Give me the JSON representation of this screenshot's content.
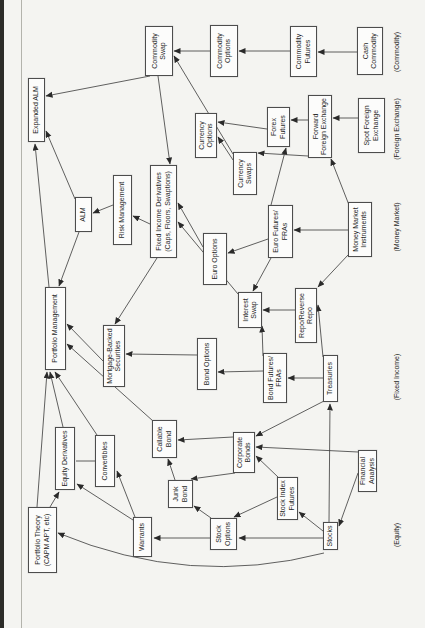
{
  "page": {
    "background": "#f4f4f1",
    "scan_edge_color": "#2c2c28",
    "fold_line_color": "#b3b3ac"
  },
  "diagram": {
    "box_border_color": "#4d4d4d",
    "box_background": "#fcfcfb",
    "line_color": "#383838",
    "text_color": "#1f1f1f",
    "nodes": [
      {
        "id": "portfolio_theory",
        "kind": "box",
        "label": "Portfolio Theory\n(CAPM APT, etc)",
        "x": 55,
        "y": 28,
        "w": 66,
        "h": 29
      },
      {
        "id": "equity_derivatives",
        "kind": "box",
        "label": "Equity Derivatives",
        "x": 138,
        "y": 55,
        "w": 63,
        "h": 20
      },
      {
        "id": "convertibles",
        "kind": "box",
        "label": "Convertibles",
        "x": 141,
        "y": 95,
        "w": 52,
        "h": 20
      },
      {
        "id": "warrants",
        "kind": "box",
        "label": "Warrants",
        "x": 71,
        "y": 133,
        "w": 40,
        "h": 19
      },
      {
        "id": "junk_bond",
        "kind": "box",
        "label": "Junk\nBond",
        "x": 120,
        "y": 168,
        "w": 28,
        "h": 25
      },
      {
        "id": "callable_bond",
        "kind": "box",
        "label": "Callable\nBond",
        "x": 170,
        "y": 152,
        "w": 38,
        "h": 25
      },
      {
        "id": "stock_options",
        "kind": "box",
        "label": "Stock\nOptions",
        "x": 78,
        "y": 210,
        "w": 32,
        "h": 27
      },
      {
        "id": "corporate_bonds",
        "kind": "box",
        "label": "Corporate\nBonds",
        "x": 155,
        "y": 233,
        "w": 41,
        "h": 22
      },
      {
        "id": "stock_index_futures",
        "kind": "box",
        "label": "Stock Index\nFutures",
        "x": 108,
        "y": 277,
        "w": 43,
        "h": 21
      },
      {
        "id": "stocks",
        "kind": "box",
        "label": "Stocks",
        "x": 78,
        "y": 323,
        "w": 28,
        "h": 15
      },
      {
        "id": "financial_analysis",
        "kind": "box",
        "label": "Financial\nAnalysis",
        "x": 136,
        "y": 358,
        "w": 42,
        "h": 19
      },
      {
        "id": "equity_label",
        "kind": "cat",
        "label": "(Equity)",
        "x": 63,
        "y": 391,
        "w": 60,
        "h": 12
      },
      {
        "id": "mortgage_backed",
        "kind": "box",
        "label": "Mortgage-Backed\nSecurities",
        "x": 241,
        "y": 103,
        "w": 62,
        "h": 22
      },
      {
        "id": "bond_options",
        "kind": "box",
        "label": "Bond Options",
        "x": 238,
        "y": 197,
        "w": 52,
        "h": 20
      },
      {
        "id": "bond_futures",
        "kind": "box",
        "label": "Bond Futures/\nFRAs",
        "x": 225,
        "y": 263,
        "w": 50,
        "h": 24
      },
      {
        "id": "treasuries",
        "kind": "box",
        "label": "Treasuries",
        "x": 226,
        "y": 323,
        "w": 47,
        "h": 15
      },
      {
        "id": "fixed_income_label",
        "kind": "cat",
        "label": "(Fixed Income)",
        "x": 221,
        "y": 391,
        "w": 60,
        "h": 12
      },
      {
        "id": "portfolio_management",
        "kind": "box",
        "label": "Portfolio Management",
        "x": 258,
        "y": 45,
        "w": 83,
        "h": 21
      },
      {
        "id": "interest_swap",
        "kind": "box",
        "label": "Interest\nSwap",
        "x": 300,
        "y": 238,
        "w": 36,
        "h": 24
      },
      {
        "id": "repo",
        "kind": "box",
        "label": "Repo/Reverse\nRepo",
        "x": 285,
        "y": 295,
        "w": 55,
        "h": 22
      },
      {
        "id": "euro_options",
        "kind": "box",
        "label": "Euro Options",
        "x": 343,
        "y": 203,
        "w": 52,
        "h": 24
      },
      {
        "id": "euro_futures",
        "kind": "box",
        "label": "Euro Futures/\nFRAs",
        "x": 370,
        "y": 268,
        "w": 53,
        "h": 25
      },
      {
        "id": "money_market_instruments",
        "kind": "box",
        "label": "Money Market\nInstruments",
        "x": 371,
        "y": 348,
        "w": 55,
        "h": 24
      },
      {
        "id": "money_market_label",
        "kind": "cat",
        "label": "(Money Market)",
        "x": 371,
        "y": 391,
        "w": 60,
        "h": 12
      },
      {
        "id": "alm",
        "kind": "box",
        "label": "ALM",
        "x": 396,
        "y": 75,
        "w": 35,
        "h": 17
      },
      {
        "id": "risk_management",
        "kind": "box",
        "label": "Risk Management",
        "x": 383,
        "y": 113,
        "w": 70,
        "h": 19
      },
      {
        "id": "fixed_income_derivatives",
        "kind": "box",
        "label": "Fixed Income Derivatives\n(Caps, Floors, Swaptions)",
        "x": 370,
        "y": 150,
        "w": 93,
        "h": 27
      },
      {
        "id": "currency_swaps",
        "kind": "box",
        "label": "Currency\nSwaps",
        "x": 433,
        "y": 233,
        "w": 43,
        "h": 24
      },
      {
        "id": "currency_options",
        "kind": "box",
        "label": "Currency\nOptions",
        "x": 470,
        "y": 195,
        "w": 45,
        "h": 22
      },
      {
        "id": "forex_futures",
        "kind": "box",
        "label": "Forex\nFutures",
        "x": 481,
        "y": 267,
        "w": 40,
        "h": 23
      },
      {
        "id": "forward_fx",
        "kind": "box",
        "label": "Forward\nForeign Exchange",
        "x": 470,
        "y": 308,
        "w": 63,
        "h": 24
      },
      {
        "id": "spot_fx",
        "kind": "box",
        "label": "Spot Foreign\nExchange",
        "x": 475,
        "y": 358,
        "w": 55,
        "h": 27
      },
      {
        "id": "fx_label",
        "kind": "cat",
        "label": "(Foreign Exchange)",
        "x": 459,
        "y": 391,
        "w": 80,
        "h": 12
      },
      {
        "id": "expanded_alm",
        "kind": "box",
        "label": "Expanded ALM",
        "x": 486,
        "y": 28,
        "w": 64,
        "h": 17
      },
      {
        "id": "commodity_swap",
        "kind": "box",
        "label": "Commodity\nSwap",
        "x": 552,
        "y": 145,
        "w": 50,
        "h": 28
      },
      {
        "id": "commodity_options",
        "kind": "box",
        "label": "Commodity\nOptions",
        "x": 551,
        "y": 210,
        "w": 52,
        "h": 28
      },
      {
        "id": "commodity_futures",
        "kind": "box",
        "label": "Commodity\nFutures",
        "x": 551,
        "y": 290,
        "w": 51,
        "h": 27
      },
      {
        "id": "cash_commodity",
        "kind": "box",
        "label": "Cash\nCommodity",
        "x": 553,
        "y": 357,
        "w": 48,
        "h": 26
      },
      {
        "id": "commodity_label",
        "kind": "cat",
        "label": "(Commodity)",
        "x": 546,
        "y": 391,
        "w": 60,
        "h": 12
      }
    ],
    "edges": [
      {
        "from": "stocks",
        "to": "stock_index_futures",
        "x1": 97,
        "y1": 323,
        "x2": 116,
        "y2": 299
      },
      {
        "from": "stocks",
        "to": "stock_options",
        "x1": 90,
        "y1": 323,
        "x2": 90,
        "y2": 239
      },
      {
        "from": "stock_index_futures",
        "to": "stock_options",
        "x1": 131,
        "y1": 277,
        "x2": 111,
        "y2": 234
      },
      {
        "from": "stock_options",
        "to": "warrants",
        "x1": 90,
        "y1": 210,
        "x2": 90,
        "y2": 154
      },
      {
        "from": "stock_options",
        "to": "junk_bond",
        "x1": 110,
        "y1": 211,
        "x2": 122,
        "y2": 194
      },
      {
        "from": "warrants",
        "to": "equity_derivatives",
        "x1": 108,
        "y1": 133,
        "x2": 144,
        "y2": 77
      },
      {
        "from": "warrants",
        "to": "convertibles",
        "x1": 111,
        "y1": 135,
        "x2": 157,
        "y2": 117
      },
      {
        "from": "convertibles",
        "to": "equity_derivatives",
        "x1": 167,
        "y1": 95,
        "x2": 167,
        "y2": 76,
        "plain": true
      },
      {
        "from": "portfolio_theory",
        "to": "equity_derivatives",
        "x1": 121,
        "y1": 50,
        "x2": 136,
        "y2": 59
      },
      {
        "from": "portfolio_theory",
        "to": "portfolio_management",
        "x1": 121,
        "y1": 37,
        "x2": 256,
        "y2": 47
      },
      {
        "from": "equity_derivatives",
        "to": "portfolio_management",
        "x1": 201,
        "y1": 63,
        "x2": 256,
        "y2": 50
      },
      {
        "from": "convertibles",
        "to": "portfolio_management",
        "x1": 193,
        "y1": 97,
        "x2": 256,
        "y2": 55
      },
      {
        "from": "callable_bond",
        "to": "portfolio_management",
        "x1": 207,
        "y1": 153,
        "x2": 284,
        "y2": 67
      },
      {
        "from": "mortgage_backed",
        "to": "portfolio_management",
        "x1": 267,
        "y1": 103,
        "x2": 304,
        "y2": 67
      },
      {
        "from": "alm",
        "to": "portfolio_management",
        "x1": 396,
        "y1": 79,
        "x2": 342,
        "y2": 59
      },
      {
        "from": "stocks",
        "to": "portfolio_theory",
        "x1": 75,
        "y1": 324,
        "cx": 40,
        "cy": 190,
        "x2": 95,
        "y2": 58,
        "curve": true
      },
      {
        "from": "financial_analysis",
        "to": "stocks",
        "x1": 155,
        "y1": 358,
        "x2": 102,
        "y2": 339
      },
      {
        "from": "financial_analysis",
        "to": "corporate_bonds",
        "x1": 176,
        "y1": 358,
        "x2": 181,
        "y2": 256
      },
      {
        "from": "treasuries",
        "to": "corporate_bonds",
        "x1": 227,
        "y1": 324,
        "x2": 192,
        "y2": 256
      },
      {
        "from": "stock_index_futures",
        "to": "corporate_bonds",
        "x1": 151,
        "y1": 278,
        "x2": 172,
        "y2": 256
      },
      {
        "from": "corporate_bonds",
        "to": "callable_bond",
        "x1": 191,
        "y1": 233,
        "x2": 188,
        "y2": 178
      },
      {
        "from": "corporate_bonds",
        "to": "junk_bond",
        "x1": 155,
        "y1": 235,
        "x2": 149,
        "y2": 191
      },
      {
        "from": "junk_bond",
        "to": "callable_bond",
        "x1": 148,
        "y1": 175,
        "x2": 169,
        "y2": 168
      },
      {
        "from": "treasuries",
        "to": "bond_futures",
        "x1": 250,
        "y1": 323,
        "x2": 250,
        "y2": 288
      },
      {
        "from": "treasuries",
        "to": "repo",
        "x1": 271,
        "y1": 323,
        "x2": 323,
        "y2": 318
      },
      {
        "from": "stocks",
        "to": "treasuries",
        "x1": 106,
        "y1": 329,
        "x2": 224,
        "y2": 330
      },
      {
        "from": "bond_futures",
        "to": "bond_options",
        "x1": 257,
        "y1": 263,
        "x2": 256,
        "y2": 218
      },
      {
        "from": "bond_futures",
        "to": "interest_swap",
        "x1": 272,
        "y1": 263,
        "x2": 302,
        "y2": 262
      },
      {
        "from": "repo",
        "to": "interest_swap",
        "x1": 318,
        "y1": 295,
        "x2": 318,
        "y2": 263
      },
      {
        "from": "euro_futures",
        "to": "interest_swap",
        "x1": 370,
        "y1": 271,
        "x2": 337,
        "y2": 253
      },
      {
        "from": "bond_options",
        "to": "mortgage_backed",
        "x1": 273,
        "y1": 197,
        "x2": 274,
        "y2": 126
      },
      {
        "from": "fixed_income_derivatives",
        "to": "mortgage_backed",
        "x1": 370,
        "y1": 157,
        "x2": 304,
        "y2": 115
      },
      {
        "from": "money_market_instruments",
        "to": "euro_futures",
        "x1": 398,
        "y1": 348,
        "x2": 398,
        "y2": 294
      },
      {
        "from": "money_market_instruments",
        "to": "repo",
        "x1": 373,
        "y1": 348,
        "x2": 341,
        "y2": 318
      },
      {
        "from": "money_market_instruments",
        "to": "forward_fx",
        "x1": 423,
        "y1": 349,
        "x2": 469,
        "y2": 331
      },
      {
        "from": "euro_futures",
        "to": "euro_options",
        "x1": 389,
        "y1": 268,
        "x2": 375,
        "y2": 228
      },
      {
        "from": "euro_futures",
        "to": "forex_futures",
        "x1": 423,
        "y1": 271,
        "x2": 480,
        "y2": 286
      },
      {
        "from": "euro_options",
        "to": "fixed_income_derivatives",
        "x1": 381,
        "y1": 203,
        "x2": 425,
        "y2": 178
      },
      {
        "from": "interest_swap",
        "to": "fixed_income_derivatives",
        "x1": 334,
        "y1": 238,
        "x2": 406,
        "y2": 178
      },
      {
        "from": "fixed_income_derivatives",
        "to": "risk_management",
        "x1": 404,
        "y1": 150,
        "x2": 412,
        "y2": 133
      },
      {
        "from": "risk_management",
        "to": "alm",
        "x1": 423,
        "y1": 113,
        "x2": 415,
        "y2": 93
      },
      {
        "from": "alm",
        "to": "expanded_alm",
        "x1": 429,
        "y1": 75,
        "x2": 497,
        "y2": 46
      },
      {
        "from": "portfolio_management",
        "to": "expanded_alm",
        "x1": 341,
        "y1": 49,
        "x2": 484,
        "y2": 35
      },
      {
        "from": "commodity_swap",
        "to": "expanded_alm",
        "x1": 552,
        "y1": 150,
        "x2": 532,
        "y2": 46
      },
      {
        "from": "commodity_swap",
        "to": "fixed_income_derivatives",
        "x1": 552,
        "y1": 158,
        "x2": 464,
        "y2": 170
      },
      {
        "from": "currency_swaps",
        "to": "commodity_swap",
        "x1": 474,
        "y1": 233,
        "x2": 572,
        "y2": 174
      },
      {
        "from": "cash_commodity",
        "to": "commodity_futures",
        "x1": 576,
        "y1": 357,
        "x2": 576,
        "y2": 318
      },
      {
        "from": "commodity_futures",
        "to": "commodity_options",
        "x1": 577,
        "y1": 290,
        "x2": 577,
        "y2": 239
      },
      {
        "from": "commodity_options",
        "to": "commodity_swap",
        "x1": 577,
        "y1": 210,
        "x2": 577,
        "y2": 174
      },
      {
        "from": "currency_swaps",
        "to": "currency_options",
        "x1": 468,
        "y1": 233,
        "x2": 491,
        "y2": 218
      },
      {
        "from": "forex_futures",
        "to": "currency_options",
        "x1": 499,
        "y1": 267,
        "x2": 506,
        "y2": 218
      },
      {
        "from": "forward_fx",
        "to": "forex_futures",
        "x1": 508,
        "y1": 308,
        "x2": 508,
        "y2": 291
      },
      {
        "from": "forward_fx",
        "to": "currency_swaps",
        "x1": 472,
        "y1": 308,
        "x2": 475,
        "y2": 258
      },
      {
        "from": "spot_fx",
        "to": "forward_fx",
        "x1": 510,
        "y1": 358,
        "x2": 510,
        "y2": 333
      }
    ]
  }
}
